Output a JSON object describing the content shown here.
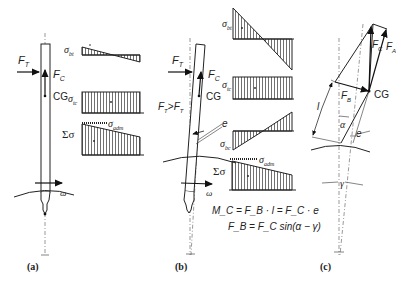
{
  "figure": {
    "panels": [
      {
        "id": "a",
        "caption": "(a)",
        "labels": {
          "force_tangential": "F",
          "force_tangential_sub": "T",
          "force_centrifugal": "F",
          "force_centrifugal_sub": "C",
          "center_of_gravity": "CG",
          "rotation": "ω"
        },
        "stress_diagrams": [
          {
            "label": "σ",
            "sub": "bt",
            "shape": "small-antisymmetric-triangle"
          },
          {
            "label": "σ",
            "sub": "tc",
            "shape": "rectangle"
          },
          {
            "label": "Σσ",
            "sub": "",
            "shape": "trapezoid",
            "limit_label": "σ",
            "limit_sub": "adm"
          }
        ]
      },
      {
        "id": "b",
        "caption": "(b)",
        "labels": {
          "force_tangential": "F",
          "force_tangential_sub": "T",
          "force_centrifugal": "F",
          "force_centrifugal_sub": "C",
          "center_of_gravity": "CG",
          "condition": "F'T > FT",
          "condition_lhs": "F",
          "condition_lhs_sub": "T",
          "condition_op": ">",
          "condition_rhs": "F",
          "condition_rhs_sub": "T",
          "eccentricity": "e",
          "rotation": "ω"
        },
        "stress_diagrams": [
          {
            "label": "σ",
            "sub": "bt",
            "shape": "large-antisymmetric-triangle"
          },
          {
            "label": "σ",
            "sub": "tc",
            "shape": "rectangle"
          },
          {
            "label": "σ",
            "sub": "bc",
            "shape": "antisymmetric-triangle"
          },
          {
            "label": "Σσ",
            "sub": "",
            "shape": "trapezoid",
            "limit_label": "σ",
            "limit_sub": "adm"
          }
        ],
        "equations": [
          "M_C = F_B · l = F_C · e",
          "F_B = F_C sin(α − γ)"
        ]
      },
      {
        "id": "c",
        "caption": "(c)",
        "labels": {
          "force_centrifugal": "F",
          "force_centrifugal_sub": "C",
          "force_axial": "F",
          "force_axial_sub": "A",
          "force_bending": "F",
          "force_bending_sub": "B",
          "center_of_gravity": "CG",
          "length": "l",
          "angle_alpha": "α",
          "eccentricity": "e",
          "angle_gamma": "γ"
        }
      }
    ]
  }
}
